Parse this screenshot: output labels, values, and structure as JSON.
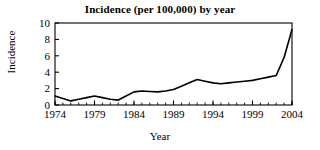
{
  "chart_data": {
    "type": "line",
    "title": "Incidence (per 100,000) by year",
    "xlabel": "Year",
    "ylabel": "Incidence",
    "xlim": [
      1974,
      2004
    ],
    "ylim": [
      0,
      10
    ],
    "xticks": [
      1974,
      1979,
      1984,
      1989,
      1994,
      1999,
      2004
    ],
    "xtick_labels": [
      "1974",
      "1979",
      "1984",
      "1989",
      "1994",
      "1999",
      "2004"
    ],
    "yticks": [
      0,
      2,
      4,
      6,
      8,
      10
    ],
    "ytick_labels": [
      "0",
      "2",
      "4",
      "6",
      "8",
      "10"
    ],
    "minor_xtick_interval": 1,
    "grid": false,
    "legend": null,
    "line_color": "#000000",
    "line_width": 1.6,
    "markers": false,
    "x": [
      1974,
      1975,
      1976,
      1977,
      1978,
      1979,
      1980,
      1981,
      1982,
      1983,
      1984,
      1985,
      1986,
      1987,
      1988,
      1989,
      1990,
      1991,
      1992,
      1993,
      1994,
      1995,
      1996,
      1997,
      1998,
      1999,
      2000,
      2001,
      2002,
      2003,
      2004
    ],
    "values": [
      1.1,
      0.8,
      0.5,
      0.7,
      0.9,
      1.1,
      0.9,
      0.7,
      0.6,
      1.1,
      1.6,
      1.7,
      1.65,
      1.6,
      1.7,
      1.9,
      2.3,
      2.7,
      3.1,
      2.9,
      2.7,
      2.6,
      2.7,
      2.8,
      2.9,
      3.0,
      3.2,
      3.4,
      3.6,
      5.8,
      9.2
    ],
    "series": [
      {
        "name": "Incidence",
        "values": [
          1.1,
          0.8,
          0.5,
          0.7,
          0.9,
          1.1,
          0.9,
          0.7,
          0.6,
          1.1,
          1.6,
          1.7,
          1.65,
          1.6,
          1.7,
          1.9,
          2.3,
          2.7,
          3.1,
          2.9,
          2.7,
          2.6,
          2.7,
          2.8,
          2.9,
          3.0,
          3.2,
          3.4,
          3.6,
          5.8,
          9.2
        ]
      }
    ]
  },
  "axes_box": {
    "left": 55,
    "right": 292,
    "top": 23,
    "bottom": 105
  }
}
